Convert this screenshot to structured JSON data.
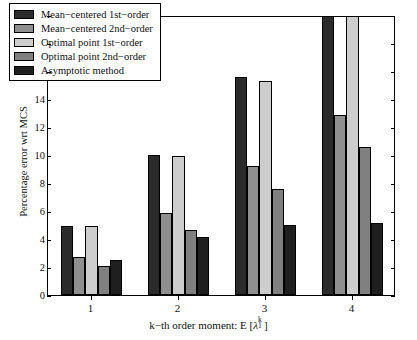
{
  "chart_data": {
    "type": "bar",
    "title": "",
    "xlabel": "k−th order moment: E [λ₁ᵏ]",
    "xlabel_parts": {
      "prefix": "k−th order moment: E [",
      "symbol": "λ",
      "superscript": "k",
      "subscript": "1",
      "suffix": "]"
    },
    "ylabel": "Percentage error wrt MCS",
    "categories": [
      "1",
      "2",
      "3",
      "4"
    ],
    "ylim": [
      0,
      20
    ],
    "ytick_labels": [
      "0",
      "2",
      "4",
      "6",
      "8",
      "10",
      "12",
      "14",
      "16",
      "18",
      "20"
    ],
    "ytick_values": [
      0,
      2,
      4,
      6,
      8,
      10,
      12,
      14,
      16,
      18,
      20
    ],
    "grid": false,
    "legend_position": "upper-left",
    "series": [
      {
        "name": "Mean−centered 1st−order",
        "color": "#2b2b2b",
        "values": [
          4.9,
          10.0,
          15.6,
          23.5
        ],
        "clipped": [
          false,
          false,
          false,
          true
        ]
      },
      {
        "name": "Mean−centered 2nd−order",
        "color": "#8f8f8f",
        "values": [
          2.7,
          5.85,
          9.25,
          12.85
        ],
        "clipped": [
          false,
          false,
          false,
          false
        ]
      },
      {
        "name": "Optimal point 1st−order",
        "color": "#cdcdcd",
        "values": [
          4.9,
          9.95,
          15.3,
          22.8
        ],
        "clipped": [
          false,
          false,
          false,
          true
        ]
      },
      {
        "name": "Optimal point 2nd−order",
        "color": "#808080",
        "values": [
          2.1,
          4.65,
          7.55,
          10.6
        ],
        "clipped": [
          false,
          false,
          false,
          false
        ]
      },
      {
        "name": "Asymptotic method",
        "color": "#1f1f1f",
        "values": [
          2.5,
          4.15,
          5.0,
          5.15
        ],
        "clipped": [
          false,
          false,
          false,
          false
        ]
      }
    ]
  }
}
